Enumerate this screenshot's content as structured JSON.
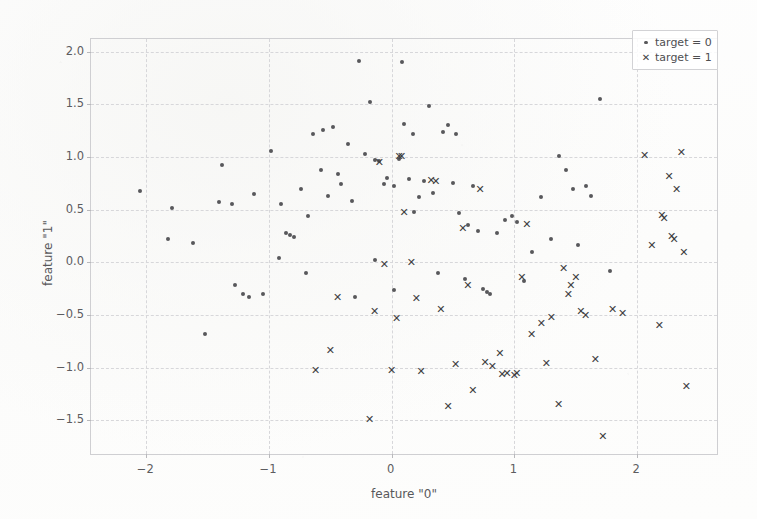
{
  "chart_data": {
    "type": "scatter",
    "title": "",
    "xlabel": "feature \"0\"",
    "ylabel": "feature \"1\"",
    "xlim": [
      -2.45,
      2.65
    ],
    "ylim": [
      -1.82,
      2.12
    ],
    "xticks": [
      -2,
      -1,
      0,
      1,
      2
    ],
    "xticklabels": [
      "−2",
      "−1",
      "0",
      "1",
      "2"
    ],
    "yticks": [
      -1.5,
      -1.0,
      -0.5,
      0.0,
      0.5,
      1.0,
      1.5,
      2.0
    ],
    "yticklabels": [
      "−1.5",
      "−1.0",
      "−0.5",
      "0.0",
      "0.5",
      "1.0",
      "1.5",
      "2.0"
    ],
    "grid": true,
    "legend_position": "upper right",
    "series": [
      {
        "name": "target = 0",
        "label": "target = 0",
        "marker": "dot",
        "color": "#58585b",
        "points": [
          [
            -2.05,
            0.68
          ],
          [
            -1.79,
            0.52
          ],
          [
            -1.82,
            0.22
          ],
          [
            -1.62,
            0.18
          ],
          [
            -1.52,
            -0.68
          ],
          [
            -1.41,
            0.57
          ],
          [
            -1.38,
            0.92
          ],
          [
            -1.3,
            0.55
          ],
          [
            -1.28,
            -0.22
          ],
          [
            -1.21,
            -0.3
          ],
          [
            -1.16,
            -0.33
          ],
          [
            -1.12,
            0.65
          ],
          [
            -1.05,
            -0.3
          ],
          [
            -0.98,
            1.06
          ],
          [
            -0.92,
            0.04
          ],
          [
            -0.86,
            0.28
          ],
          [
            -0.83,
            0.26
          ],
          [
            -0.8,
            0.24
          ],
          [
            -0.74,
            0.7
          ],
          [
            -0.7,
            -0.1
          ],
          [
            -0.64,
            1.22
          ],
          [
            -0.58,
            0.88
          ],
          [
            -0.56,
            1.26
          ],
          [
            -0.52,
            0.63
          ],
          [
            -0.48,
            1.28
          ],
          [
            -0.44,
            0.84
          ],
          [
            -0.41,
            0.74
          ],
          [
            -0.36,
            1.12
          ],
          [
            -0.32,
            0.58
          ],
          [
            -0.27,
            1.91
          ],
          [
            -0.22,
            1.03
          ],
          [
            -0.18,
            1.52
          ],
          [
            -0.14,
            0.97
          ],
          [
            -0.1,
            0.96
          ],
          [
            -0.06,
            0.74
          ],
          [
            -0.04,
            0.8
          ],
          [
            0.02,
            0.72
          ],
          [
            0.06,
            0.98
          ],
          [
            0.08,
            1.9
          ],
          [
            0.1,
            1.31
          ],
          [
            0.14,
            0.79
          ],
          [
            0.17,
            1.22
          ],
          [
            0.22,
            0.62
          ],
          [
            0.26,
            0.77
          ],
          [
            0.3,
            1.48
          ],
          [
            0.34,
            0.66
          ],
          [
            0.42,
            1.24
          ],
          [
            0.46,
            1.3
          ],
          [
            0.5,
            0.75
          ],
          [
            0.52,
            1.22
          ],
          [
            0.55,
            0.47
          ],
          [
            0.62,
            0.35
          ],
          [
            0.66,
            0.72
          ],
          [
            0.7,
            0.3
          ],
          [
            0.74,
            -0.25
          ],
          [
            0.8,
            -0.3
          ],
          [
            0.86,
            0.28
          ],
          [
            0.92,
            0.4
          ],
          [
            0.98,
            0.44
          ],
          [
            1.02,
            0.38
          ],
          [
            1.08,
            -0.18
          ],
          [
            1.14,
            0.1
          ],
          [
            1.22,
            0.62
          ],
          [
            1.3,
            0.22
          ],
          [
            1.36,
            1.01
          ],
          [
            1.42,
            0.88
          ],
          [
            1.48,
            0.7
          ],
          [
            1.52,
            0.16
          ],
          [
            1.58,
            0.72
          ],
          [
            1.62,
            0.63
          ],
          [
            1.7,
            1.55
          ],
          [
            1.78,
            -0.08
          ],
          [
            0.18,
            0.48
          ],
          [
            0.02,
            -0.26
          ],
          [
            -0.3,
            -0.33
          ],
          [
            -0.14,
            0.02
          ],
          [
            0.38,
            -0.1
          ],
          [
            0.6,
            -0.16
          ],
          [
            -0.9,
            0.55
          ],
          [
            -0.68,
            0.44
          ],
          [
            0.78,
            -0.28
          ]
        ]
      },
      {
        "name": "target = 1",
        "label": "target = 1",
        "marker": "cross",
        "color": "#3f3f42",
        "points": [
          [
            -0.62,
            -1.02
          ],
          [
            -0.5,
            -0.83
          ],
          [
            -0.44,
            -0.33
          ],
          [
            -0.18,
            -1.49
          ],
          [
            -0.14,
            -0.46
          ],
          [
            -0.1,
            0.95
          ],
          [
            -0.06,
            -0.02
          ],
          [
            0.0,
            -1.02
          ],
          [
            0.04,
            -0.53
          ],
          [
            0.06,
            1.01
          ],
          [
            0.08,
            1.01
          ],
          [
            0.1,
            0.48
          ],
          [
            0.16,
            0.0
          ],
          [
            0.2,
            -0.34
          ],
          [
            0.24,
            -1.03
          ],
          [
            0.32,
            0.78
          ],
          [
            0.36,
            0.77
          ],
          [
            0.4,
            -0.44
          ],
          [
            0.46,
            -1.36
          ],
          [
            0.52,
            -0.97
          ],
          [
            0.58,
            0.33
          ],
          [
            0.62,
            -0.22
          ],
          [
            0.66,
            -1.21
          ],
          [
            0.72,
            0.7
          ],
          [
            0.76,
            -0.95
          ],
          [
            0.82,
            -0.98
          ],
          [
            0.88,
            -0.86
          ],
          [
            0.94,
            -1.05
          ],
          [
            1.0,
            -1.07
          ],
          [
            1.02,
            -1.05
          ],
          [
            1.06,
            -0.14
          ],
          [
            1.1,
            0.36
          ],
          [
            1.14,
            -0.68
          ],
          [
            1.22,
            -0.58
          ],
          [
            1.3,
            -0.52
          ],
          [
            1.36,
            -1.35
          ],
          [
            1.4,
            -0.05
          ],
          [
            1.44,
            -0.3
          ],
          [
            1.46,
            -0.22
          ],
          [
            1.5,
            -0.14
          ],
          [
            1.54,
            -0.46
          ],
          [
            1.58,
            -0.5
          ],
          [
            1.66,
            -0.92
          ],
          [
            1.72,
            -1.65
          ],
          [
            1.8,
            -0.44
          ],
          [
            1.88,
            -0.48
          ],
          [
            2.06,
            1.02
          ],
          [
            2.12,
            0.16
          ],
          [
            2.18,
            -0.6
          ],
          [
            2.2,
            0.45
          ],
          [
            2.22,
            0.42
          ],
          [
            2.26,
            0.82
          ],
          [
            2.28,
            0.25
          ],
          [
            2.3,
            0.22
          ],
          [
            2.32,
            0.7
          ],
          [
            2.36,
            1.05
          ],
          [
            2.38,
            0.1
          ],
          [
            2.4,
            -1.17
          ],
          [
            1.26,
            -0.96
          ],
          [
            0.9,
            -1.06
          ]
        ]
      }
    ]
  },
  "legend": {
    "entries": [
      {
        "marker": "dot-marker",
        "label": "target = 0"
      },
      {
        "marker": "cross-marker",
        "label": "target = 1"
      }
    ]
  }
}
